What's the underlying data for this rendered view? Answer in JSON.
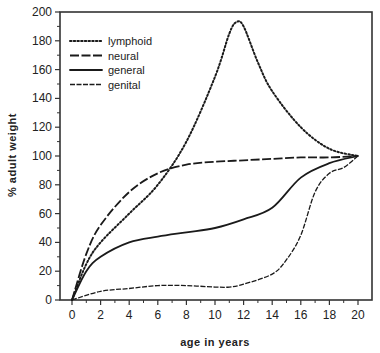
{
  "chart_data": {
    "type": "line",
    "title": "",
    "xlabel": "age in years",
    "ylabel": "% adult weight",
    "xlim": [
      0,
      20
    ],
    "ylim": [
      0,
      200
    ],
    "x_ticks": [
      0,
      2,
      4,
      6,
      8,
      10,
      12,
      14,
      16,
      18,
      20
    ],
    "y_ticks": [
      0,
      20,
      40,
      60,
      80,
      100,
      120,
      140,
      160,
      180,
      200
    ],
    "grid": false,
    "legend_position": "upper-left",
    "series": [
      {
        "name": "lymphoid",
        "style": "dotted",
        "x": [
          0,
          1,
          2,
          4,
          6,
          8,
          10,
          11,
          11.5,
          12,
          13,
          14,
          16,
          18,
          20
        ],
        "y": [
          0,
          25,
          40,
          60,
          80,
          110,
          155,
          185,
          193,
          190,
          165,
          145,
          120,
          105,
          100
        ]
      },
      {
        "name": "neural",
        "style": "dashed",
        "x": [
          0,
          1,
          2,
          4,
          6,
          8,
          10,
          12,
          14,
          16,
          18,
          20
        ],
        "y": [
          0,
          32,
          52,
          75,
          88,
          94,
          96,
          97,
          98,
          99,
          99,
          100
        ]
      },
      {
        "name": "general",
        "style": "solid",
        "x": [
          0,
          1,
          2,
          4,
          6,
          8,
          10,
          12,
          14,
          16,
          18,
          20
        ],
        "y": [
          0,
          20,
          30,
          40,
          44,
          47,
          50,
          56,
          64,
          85,
          95,
          100
        ]
      },
      {
        "name": "genital",
        "style": "thin-dashed",
        "x": [
          0,
          2,
          4,
          6,
          8,
          10,
          11,
          12,
          14,
          15,
          16,
          17,
          18,
          19,
          20
        ],
        "y": [
          0,
          6,
          8,
          10,
          10,
          9,
          9,
          11,
          18,
          28,
          45,
          75,
          88,
          92,
          100
        ]
      }
    ]
  },
  "labels": {
    "xlabel": "age in years",
    "ylabel": "% adult weight",
    "legend": [
      "lymphoid",
      "neural",
      "general",
      "genital"
    ]
  }
}
